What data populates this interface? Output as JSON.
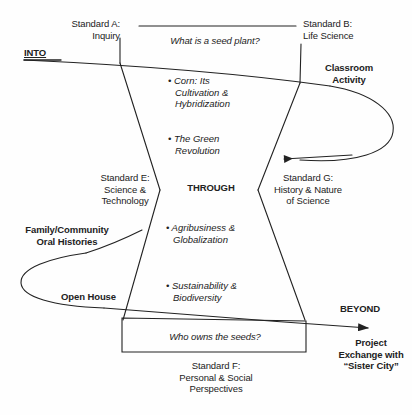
{
  "diagram": {
    "title_text": "Into-Through-Beyond curriculum map for a seed plant unit",
    "ink_color": "#222222",
    "background_color": "#fefefe",
    "phases": {
      "into": "INTO",
      "through": "THROUGH",
      "beyond": "BEYOND"
    },
    "standards": {
      "a": "Standard A:\nInquiry",
      "b": "Standard B:\nLife Science",
      "e": "Standard E:\nScience &\nTechnology",
      "g": "Standard G:\nHistory & Nature\nof Science",
      "f": "Standard F:\nPersonal & Social\nPerspectives"
    },
    "questions": {
      "top": "What is a seed plant?",
      "bottom": "Who owns the seeds?"
    },
    "topics": [
      "• Corn: Its\nCultivation &\nHybridization",
      "• The Green\nRevolution",
      "• Agribusiness &\nGlobalization",
      "• Sustainability &\nBiodiversity"
    ],
    "connections": {
      "classroom_activity": "Classroom\nActivity",
      "family_oral_histories": "Family/Community\nOral Histories",
      "open_house": "Open House",
      "project_exchange": "Project\nExchange with\n“Sister City”"
    }
  }
}
